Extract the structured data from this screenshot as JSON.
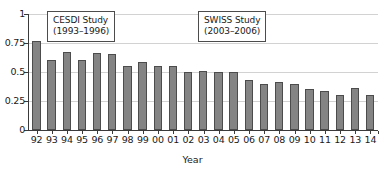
{
  "chart_data": {
    "type": "bar",
    "title": "",
    "subtitle": "",
    "xlabel": "Year",
    "ylabel": "",
    "categories": [
      "92",
      "93",
      "94",
      "95",
      "96",
      "97",
      "98",
      "99",
      "00",
      "01",
      "02",
      "03",
      "04",
      "05",
      "06",
      "07",
      "08",
      "09",
      "10",
      "11",
      "12",
      "13",
      "14"
    ],
    "values": [
      0.77,
      0.605,
      0.675,
      0.605,
      0.665,
      0.655,
      0.55,
      0.585,
      0.55,
      0.55,
      0.5,
      0.51,
      0.5,
      0.5,
      0.43,
      0.4,
      0.41,
      0.4,
      0.35,
      0.34,
      0.3,
      0.36,
      0.3
    ],
    "ylim": [
      0,
      1
    ],
    "ytick_labels": [
      "0",
      "0.25",
      "0.5",
      "0.75",
      "1"
    ],
    "ytick_values": [
      0,
      0.25,
      0.5,
      0.75,
      1
    ],
    "grid": true,
    "grid_axis": "y",
    "legend": false,
    "bar_color": "#848484",
    "bar_edge_color": "#4c4c4c",
    "axis_color": "#3a3a3a",
    "gridline_color": "#d2d2d2",
    "annotations": [
      {
        "id": "cesdi",
        "line1": "CESDI Study",
        "line2": "(1993–1996)"
      },
      {
        "id": "swiss",
        "line1": "SWISS Study",
        "line2": "(2003–2006)"
      }
    ]
  }
}
